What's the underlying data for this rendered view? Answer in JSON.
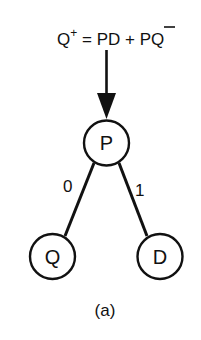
{
  "equation": {
    "lhs": "Q",
    "lhs_superscript": "+",
    "equals": "=",
    "term1": "PD",
    "plus": "+",
    "term2_barred": "P",
    "term2_rest": "Q",
    "full_text": "Q+ = PD + P̄Q"
  },
  "nodes": {
    "root": {
      "label": "P"
    },
    "left": {
      "label": "Q"
    },
    "right": {
      "label": "D"
    }
  },
  "edges": {
    "left": {
      "label": "0"
    },
    "right": {
      "label": "1"
    }
  },
  "caption": "(a)",
  "colors": {
    "stroke": "#111111",
    "background": "#ffffff"
  }
}
